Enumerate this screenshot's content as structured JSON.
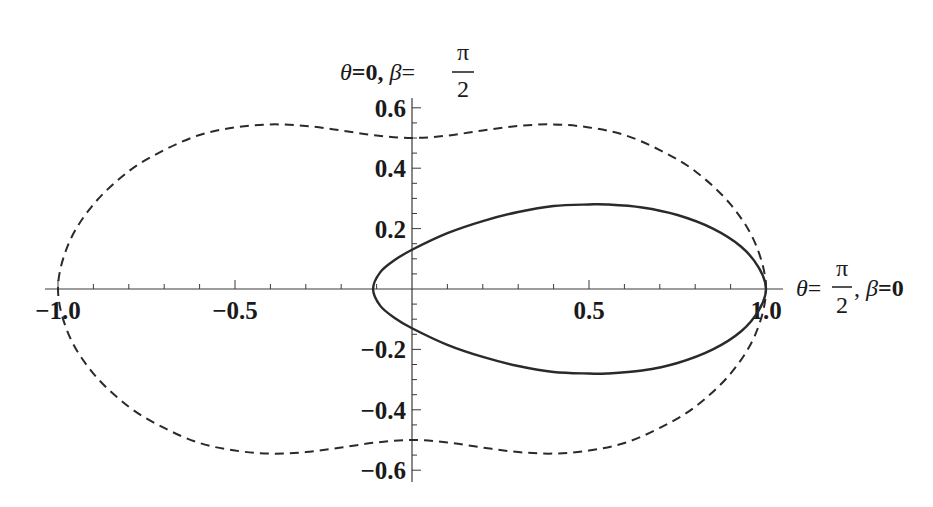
{
  "chart_data": {
    "type": "line",
    "title": "",
    "xlabel": "θ=π/2, β=0",
    "ylabel": "θ=0, β=π/2",
    "xlim": [
      -1.05,
      1.05
    ],
    "ylim": [
      -0.63,
      0.63
    ],
    "x_ticks": [
      -1.0,
      -0.5,
      0.5,
      1.0
    ],
    "x_tick_labels": [
      "-1.0",
      "-0.5",
      "0.5",
      "1.0"
    ],
    "y_ticks": [
      -0.6,
      -0.4,
      -0.2,
      0.2,
      0.4,
      0.6
    ],
    "y_tick_labels": [
      "-0.6",
      "-0.4",
      "-0.2",
      "0.2",
      "0.4",
      "0.6"
    ],
    "x_minor_step": 0.1,
    "y_minor_step": 0.05,
    "grid": false,
    "legend": null,
    "series": [
      {
        "name": "dashed-curve",
        "style": "dashed",
        "color": "#2a2a2a",
        "closed": true,
        "x": [
          1.0,
          0.97,
          0.9,
          0.8,
          0.7,
          0.6,
          0.5,
          0.4,
          0.3,
          0.2,
          0.1,
          0.0,
          -0.1,
          -0.2,
          -0.3,
          -0.4,
          -0.5,
          -0.6,
          -0.7,
          -0.8,
          -0.9,
          -0.97,
          -1.0,
          -0.97,
          -0.9,
          -0.8,
          -0.7,
          -0.6,
          -0.5,
          -0.4,
          -0.3,
          -0.2,
          -0.1,
          0.0,
          0.1,
          0.2,
          0.3,
          0.4,
          0.5,
          0.6,
          0.7,
          0.8,
          0.9,
          0.97,
          1.0
        ],
        "y": [
          0.0,
          0.15,
          0.28,
          0.39,
          0.46,
          0.51,
          0.535,
          0.545,
          0.54,
          0.525,
          0.508,
          0.5,
          0.508,
          0.525,
          0.54,
          0.545,
          0.535,
          0.51,
          0.46,
          0.39,
          0.28,
          0.15,
          0.0,
          -0.15,
          -0.28,
          -0.39,
          -0.46,
          -0.51,
          -0.535,
          -0.545,
          -0.54,
          -0.525,
          -0.508,
          -0.5,
          -0.508,
          -0.525,
          -0.54,
          -0.545,
          -0.535,
          -0.51,
          -0.46,
          -0.39,
          -0.28,
          -0.15,
          0.0
        ]
      },
      {
        "name": "solid-curve",
        "style": "solid",
        "color": "#2a2a2a",
        "closed": true,
        "x": [
          1.0,
          0.98,
          0.93,
          0.85,
          0.75,
          0.65,
          0.55,
          0.5,
          0.4,
          0.3,
          0.2,
          0.1,
          0.0,
          -0.05,
          -0.09,
          -0.11,
          -0.09,
          -0.05,
          0.0,
          0.1,
          0.2,
          0.3,
          0.4,
          0.5,
          0.55,
          0.65,
          0.75,
          0.85,
          0.93,
          0.98,
          1.0
        ],
        "y": [
          0.0,
          0.07,
          0.14,
          0.2,
          0.245,
          0.27,
          0.28,
          0.28,
          0.275,
          0.255,
          0.225,
          0.185,
          0.13,
          0.095,
          0.055,
          0.0,
          -0.055,
          -0.095,
          -0.13,
          -0.185,
          -0.225,
          -0.255,
          -0.275,
          -0.28,
          -0.28,
          -0.27,
          -0.245,
          -0.2,
          -0.14,
          -0.07,
          0.0
        ]
      }
    ]
  },
  "layout": {
    "origin_px": [
      412,
      289
    ],
    "px_per_unit_x": 354,
    "px_per_unit_y": 302,
    "x_axis_px": [
      45,
      783
    ],
    "y_axis_px": [
      98,
      482
    ]
  },
  "labels": {
    "y_axis_title": {
      "prefix": "θ",
      "eq1": "=0, ",
      "beta": "β",
      "eq2": "=",
      "num": "π",
      "den": "2"
    },
    "x_axis_title": {
      "theta": "θ",
      "eq1": "=",
      "num": "π",
      "den": "2",
      "sep": ", ",
      "beta": "β",
      "eq2": "=0"
    }
  }
}
